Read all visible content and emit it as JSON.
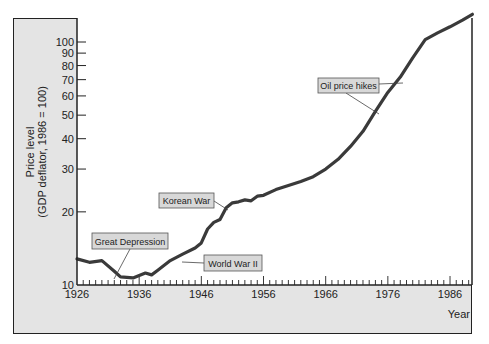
{
  "chart_data": {
    "type": "line",
    "title": "",
    "xlabel": "Year",
    "ylabel": "Price level\n(GDP deflator, 1986 = 100)",
    "ylabel_line1": "Price level",
    "ylabel_line2": "(GDP deflator, 1986 = 100)",
    "yscale": "log",
    "ylim": [
      10,
      120
    ],
    "xlim": [
      1926,
      1989.6
    ],
    "x_ticks": [
      "1926",
      "1936",
      "1946",
      "1956",
      "1966",
      "1976",
      "1986"
    ],
    "y_ticks": [
      "10",
      "20",
      "30",
      "40",
      "50",
      "60",
      "70",
      "80",
      "90",
      "100"
    ],
    "grid": false,
    "series": [
      {
        "name": "Price level",
        "x": [
          1926,
          1928,
          1930,
          1932,
          1933,
          1935,
          1937,
          1938,
          1939,
          1941,
          1943,
          1945,
          1946,
          1947,
          1948,
          1949,
          1950,
          1951,
          1952,
          1953,
          1954,
          1955,
          1956,
          1958,
          1960,
          1962,
          1964,
          1966,
          1968,
          1970,
          1972,
          1974,
          1976,
          1978,
          1980,
          1982,
          1984,
          1986,
          1988,
          1989.6
        ],
        "values": [
          12.8,
          12.4,
          12.6,
          11.4,
          10.8,
          10.7,
          11.2,
          11.0,
          11.5,
          12.6,
          13.4,
          14.2,
          14.9,
          17.0,
          18.1,
          18.6,
          20.8,
          21.8,
          22.0,
          22.4,
          22.2,
          23.2,
          23.4,
          24.7,
          25.7,
          26.7,
          27.9,
          30.0,
          32.9,
          37.2,
          42.9,
          51.8,
          62.0,
          71.7,
          86.1,
          102.2,
          109.0,
          115.5,
          123.0,
          130.0
        ]
      }
    ],
    "annotations": [
      {
        "label": "Great Depression",
        "year": 1933
      },
      {
        "label": "World War II",
        "year": 1945
      },
      {
        "label": "Korean War",
        "year": 1951
      },
      {
        "label": "Oil price hikes",
        "year": 1974
      }
    ]
  },
  "colors": {
    "frame_bg": "#e4e4e4",
    "plot_bg": "#ffffff",
    "line": "#3a3a3a",
    "label_box": "#d8d8d8"
  }
}
